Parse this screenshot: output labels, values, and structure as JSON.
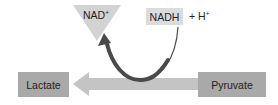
{
  "diagram": {
    "nodes": {
      "nad_plus": {
        "label": "NAD",
        "superscript": "+"
      },
      "nadh": {
        "label": "NADH"
      },
      "h_plus": {
        "prefix": "+ H",
        "superscript": "+"
      },
      "lactate": {
        "label": "Lactate"
      },
      "pyruvate": {
        "label": "Pyruvate"
      }
    },
    "arrows": [
      {
        "from": "pyruvate",
        "to": "lactate",
        "style": "wide light gray block arrow"
      },
      {
        "from": "nadh",
        "to": "nad_plus",
        "style": "curved dark gray arrow"
      }
    ],
    "colors": {
      "box_fill": "#a9a9a9",
      "nadh_fill": "#dcdcdc",
      "triangle_fill": "#d3d3d3",
      "block_arrow": "#c4c4c4",
      "curved_arrow": "#4a4a4a",
      "text": "#222222"
    }
  }
}
